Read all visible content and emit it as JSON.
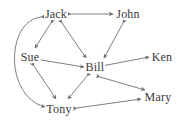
{
  "figure": {
    "width": 183,
    "height": 124,
    "background_color": "#ffffff",
    "edge_color": "#6f6f6f",
    "label_color": "#3a3a3a"
  },
  "graph_data": {
    "type": "diagram",
    "diagram_kind": "directed-graph",
    "directed": true,
    "bidirectional_edges": true,
    "node_count": 7,
    "edge_count": 11,
    "nodes": [
      {
        "id": "jack",
        "label": "Jack",
        "x": 56,
        "y": 14
      },
      {
        "id": "john",
        "label": "John",
        "x": 128,
        "y": 14
      },
      {
        "id": "sue",
        "label": "Sue",
        "x": 30,
        "y": 57
      },
      {
        "id": "bill",
        "label": "Bill",
        "x": 95,
        "y": 67
      },
      {
        "id": "ken",
        "label": "Ken",
        "x": 162,
        "y": 57
      },
      {
        "id": "mary",
        "label": "Mary",
        "x": 158,
        "y": 97
      },
      {
        "id": "tony",
        "label": "Tony",
        "x": 59,
        "y": 109
      }
    ],
    "edges": [
      {
        "source": "jack",
        "target": "john",
        "arrows": "both",
        "shape": "straight"
      },
      {
        "source": "jack",
        "target": "sue",
        "arrows": "both",
        "shape": "straight"
      },
      {
        "source": "jack",
        "target": "bill",
        "arrows": "both",
        "shape": "straight"
      },
      {
        "source": "jack",
        "target": "tony",
        "arrows": "both",
        "shape": "curved"
      },
      {
        "source": "john",
        "target": "bill",
        "arrows": "both",
        "shape": "straight"
      },
      {
        "source": "sue",
        "target": "bill",
        "arrows": "both",
        "shape": "straight"
      },
      {
        "source": "sue",
        "target": "tony",
        "arrows": "both",
        "shape": "straight"
      },
      {
        "source": "bill",
        "target": "ken",
        "arrows": "both",
        "shape": "straight"
      },
      {
        "source": "bill",
        "target": "tony",
        "arrows": "both",
        "shape": "straight"
      },
      {
        "source": "bill",
        "target": "mary",
        "arrows": "both",
        "shape": "straight"
      },
      {
        "source": "tony",
        "target": "mary",
        "arrows": "both",
        "shape": "straight"
      }
    ]
  }
}
